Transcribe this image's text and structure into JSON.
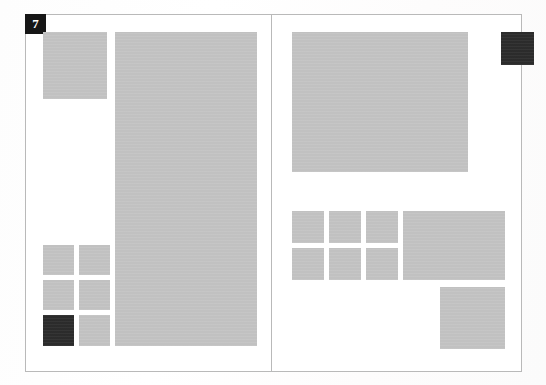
{
  "document": {
    "kind": "page-spread-wireframe",
    "page_badge": "7",
    "page_count_visible": 2
  },
  "palette": {
    "paper": "#ffffff",
    "border": "#b9b9b9",
    "placeholder_gray": "#c3c3c3",
    "accent_dark": "#2c2c2c",
    "badge_background": "#161616",
    "badge_text": "#ffffff"
  },
  "left_page": {
    "name": "left-page",
    "blocks": [
      {
        "id": "left-top-square",
        "label": "image-placeholder",
        "tone": "gray",
        "x": 17,
        "y": 17,
        "w": 64,
        "h": 67
      },
      {
        "id": "left-tall-column",
        "label": "image-placeholder",
        "tone": "gray",
        "x": 89,
        "y": 17,
        "w": 142,
        "h": 314
      },
      {
        "id": "left-grid-r1c1",
        "label": "image-placeholder",
        "tone": "gray",
        "x": 17,
        "y": 230,
        "w": 31,
        "h": 30
      },
      {
        "id": "left-grid-r1c2",
        "label": "image-placeholder",
        "tone": "gray",
        "x": 53,
        "y": 230,
        "w": 31,
        "h": 30
      },
      {
        "id": "left-grid-r2c1",
        "label": "image-placeholder",
        "tone": "gray",
        "x": 17,
        "y": 265,
        "w": 31,
        "h": 30
      },
      {
        "id": "left-grid-r2c2",
        "label": "image-placeholder",
        "tone": "gray",
        "x": 53,
        "y": 265,
        "w": 31,
        "h": 30
      },
      {
        "id": "left-grid-r3c1",
        "label": "accent-block",
        "tone": "dark",
        "x": 17,
        "y": 300,
        "w": 31,
        "h": 31
      },
      {
        "id": "left-grid-r3c2",
        "label": "image-placeholder",
        "tone": "gray",
        "x": 53,
        "y": 300,
        "w": 31,
        "h": 31
      }
    ]
  },
  "right_page": {
    "name": "right-page",
    "blocks": [
      {
        "id": "right-hero-rect",
        "label": "image-placeholder",
        "tone": "gray",
        "x": 20,
        "y": 17,
        "w": 176,
        "h": 140
      },
      {
        "id": "right-accent-square",
        "label": "accent-block",
        "tone": "dark",
        "x": 229,
        "y": 17,
        "w": 33,
        "h": 33
      },
      {
        "id": "right-grid-r1c1",
        "label": "image-placeholder",
        "tone": "gray",
        "x": 20,
        "y": 196,
        "w": 32,
        "h": 32
      },
      {
        "id": "right-grid-r1c2",
        "label": "image-placeholder",
        "tone": "gray",
        "x": 57,
        "y": 196,
        "w": 32,
        "h": 32
      },
      {
        "id": "right-grid-r1c3",
        "label": "image-placeholder",
        "tone": "gray",
        "x": 94,
        "y": 196,
        "w": 32,
        "h": 32
      },
      {
        "id": "right-grid-r2c1",
        "label": "image-placeholder",
        "tone": "gray",
        "x": 20,
        "y": 233,
        "w": 32,
        "h": 32
      },
      {
        "id": "right-grid-r2c2",
        "label": "image-placeholder",
        "tone": "gray",
        "x": 57,
        "y": 233,
        "w": 32,
        "h": 32
      },
      {
        "id": "right-grid-r2c3",
        "label": "image-placeholder",
        "tone": "gray",
        "x": 94,
        "y": 233,
        "w": 32,
        "h": 32
      },
      {
        "id": "right-wide-rect",
        "label": "image-placeholder",
        "tone": "gray",
        "x": 131,
        "y": 196,
        "w": 102,
        "h": 69
      },
      {
        "id": "right-bottom-square",
        "label": "image-placeholder",
        "tone": "gray",
        "x": 168,
        "y": 272,
        "w": 65,
        "h": 62
      }
    ]
  }
}
